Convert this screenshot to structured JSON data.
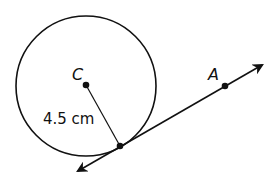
{
  "diagram": {
    "circle": {
      "center_label": "C",
      "cx": 86,
      "cy": 86,
      "r": 70
    },
    "radius_label": "4.5 cm",
    "point_a_label": "A",
    "tangent_point": {
      "x": 120,
      "y": 146
    },
    "point_a": {
      "x": 225,
      "y": 85
    },
    "colors": {
      "stroke": "#111111",
      "background": "#ffffff"
    }
  }
}
